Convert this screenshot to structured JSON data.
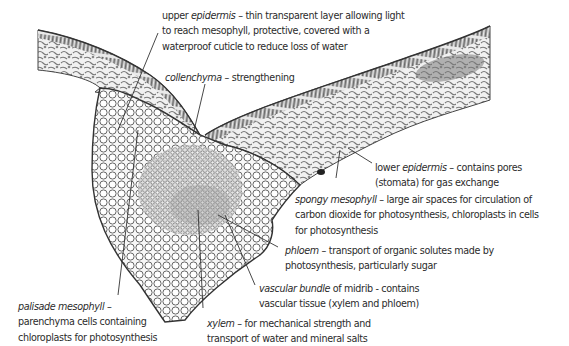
{
  "diagram": {
    "labels": [
      {
        "id": "upper-epidermis",
        "term": "upper epidermis",
        "lines": [
          "thin transparent layer allowing light",
          "to reach mesophyll, protective, covered with a",
          "waterproof cuticle to reduce loss of water"
        ]
      },
      {
        "id": "collenchyma",
        "term": "collenchyma",
        "lines": [
          "strengthening"
        ]
      },
      {
        "id": "lower-epidermis",
        "term": "lower epidermis",
        "lines": [
          "contains pores",
          "(stomata) for gas exchange"
        ]
      },
      {
        "id": "spongy-mesophyll",
        "term": "spongy mesophyll",
        "lines": [
          "large air spaces for circulation of",
          "carbon dioxide for photosynthesis, chloroplasts in cells",
          "for photosynthesis"
        ]
      },
      {
        "id": "phloem",
        "term": "phloem",
        "lines": [
          "transport of organic solutes made by",
          "photosynthesis, particularly sugar"
        ]
      },
      {
        "id": "vascular-bundle",
        "term": "vascular bundle",
        "suffix": " of midrib - contains",
        "lines": [
          "vascular tissue (xylem and phloem)"
        ]
      },
      {
        "id": "palisade-mesophyll",
        "term": "palisade mesophyll",
        "lines": [
          "parenchyma cells containing",
          "chloroplasts for photosynthesis"
        ]
      },
      {
        "id": "xylem",
        "term": "xylem",
        "lines": [
          "for mechanical strength and",
          "transport of water and mineral salts"
        ]
      }
    ],
    "dash": " – ",
    "colors": {
      "ink": "#2b2b2b",
      "tissue": "#5a5a5a",
      "cell_fill": "#f4f4f4"
    }
  }
}
